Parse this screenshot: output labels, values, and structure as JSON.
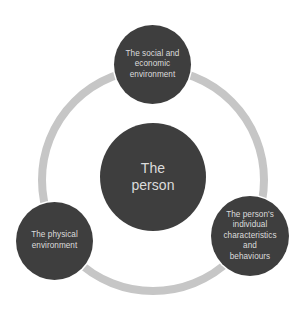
{
  "diagram": {
    "type": "cycle",
    "colors": {
      "node_fill": "#3e3e3e",
      "node_text": "#dcdcdc",
      "ring": "#c6c6c6",
      "background": "#ffffff"
    },
    "center": {
      "label": "The\nperson"
    },
    "nodes": [
      {
        "id": "top",
        "label": "The social and\neconomic\nenvironment"
      },
      {
        "id": "right",
        "label": "The person's\nindividual\ncharacteristics\nand\nbehaviours"
      },
      {
        "id": "left",
        "label": "The physical\nenvironment"
      }
    ]
  }
}
